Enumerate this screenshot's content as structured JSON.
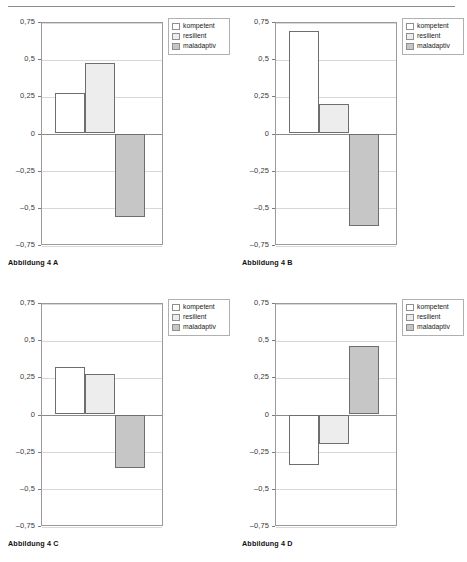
{
  "page": {
    "header_rule": "horizontal-rule"
  },
  "legend": {
    "items": [
      {
        "label": "kompetent",
        "color": "#ffffff"
      },
      {
        "label": "resilient",
        "color": "#ededed"
      },
      {
        "label": "maladaptiv",
        "color": "#c6c6c6"
      }
    ]
  },
  "axis": {
    "ticks": [
      "0,75",
      "0,5",
      "0,25",
      "0",
      "-0,25",
      "-0,5",
      "-0,75"
    ],
    "values": [
      0.75,
      0.5,
      0.25,
      0,
      -0.25,
      -0.5,
      -0.75
    ],
    "ymin": -0.75,
    "ymax": 0.75
  },
  "figures": [
    {
      "caption": "Abbildung 4 A"
    },
    {
      "caption": "Abbildung 4 B"
    },
    {
      "caption": "Abbildung 4 C"
    },
    {
      "caption": "Abbildung 4 D"
    }
  ],
  "chart_data": [
    {
      "type": "bar",
      "title": "Abbildung 4 A",
      "categories": [
        "kompetent",
        "resilient",
        "maladaptiv"
      ],
      "values": [
        0.27,
        0.475,
        -0.56
      ],
      "xlabel": "",
      "ylabel": "",
      "ylim": [
        -0.75,
        0.75
      ],
      "yticks": [
        -0.75,
        -0.5,
        -0.25,
        0,
        0.25,
        0.5,
        0.75
      ],
      "ytick_labels": [
        "-0,75",
        "-0,5",
        "-0,25",
        "0",
        "0,25",
        "0,5",
        "0,75"
      ],
      "grid": true,
      "legend": [
        "kompetent",
        "resilient",
        "maladaptiv"
      ],
      "legend_position": "top-right-outside",
      "colors": [
        "#ffffff",
        "#ededed",
        "#c6c6c6"
      ]
    },
    {
      "type": "bar",
      "title": "Abbildung 4 B",
      "categories": [
        "kompetent",
        "resilient",
        "maladaptiv"
      ],
      "values": [
        0.69,
        0.2,
        -0.62
      ],
      "xlabel": "",
      "ylabel": "",
      "ylim": [
        -0.75,
        0.75
      ],
      "yticks": [
        -0.75,
        -0.5,
        -0.25,
        0,
        0.25,
        0.5,
        0.75
      ],
      "ytick_labels": [
        "-0,75",
        "-0,5",
        "-0,25",
        "0",
        "0,25",
        "0,5",
        "0,75"
      ],
      "grid": true,
      "legend": [
        "kompetent",
        "resilient",
        "maladaptiv"
      ],
      "legend_position": "top-right-outside",
      "colors": [
        "#ffffff",
        "#ededed",
        "#c6c6c6"
      ]
    },
    {
      "type": "bar",
      "title": "Abbildung 4 C",
      "categories": [
        "kompetent",
        "resilient",
        "maladaptiv"
      ],
      "values": [
        0.32,
        0.275,
        -0.36
      ],
      "xlabel": "",
      "ylabel": "",
      "ylim": [
        -0.75,
        0.75
      ],
      "yticks": [
        -0.75,
        -0.5,
        -0.25,
        0,
        0.25,
        0.5,
        0.75
      ],
      "ytick_labels": [
        "-0,75",
        "-0,5",
        "-0,25",
        "0",
        "0,25",
        "0,5",
        "0,75"
      ],
      "grid": true,
      "legend": [
        "kompetent",
        "resilient",
        "maladaptiv"
      ],
      "legend_position": "top-right-outside",
      "colors": [
        "#ffffff",
        "#ededed",
        "#c6c6c6"
      ]
    },
    {
      "type": "bar",
      "title": "Abbildung 4 D",
      "categories": [
        "kompetent",
        "resilient",
        "maladaptiv"
      ],
      "values": [
        -0.34,
        -0.2,
        0.46
      ],
      "xlabel": "",
      "ylabel": "",
      "ylim": [
        -0.75,
        0.75
      ],
      "yticks": [
        -0.75,
        -0.5,
        -0.25,
        0,
        0.25,
        0.5,
        0.75
      ],
      "ytick_labels": [
        "-0,75",
        "-0,5",
        "-0,25",
        "0",
        "0,25",
        "0,5",
        "0,75"
      ],
      "grid": true,
      "legend": [
        "kompetent",
        "resilient",
        "maladaptiv"
      ],
      "legend_position": "top-right-outside",
      "colors": [
        "#ffffff",
        "#ededed",
        "#c6c6c6"
      ]
    }
  ]
}
